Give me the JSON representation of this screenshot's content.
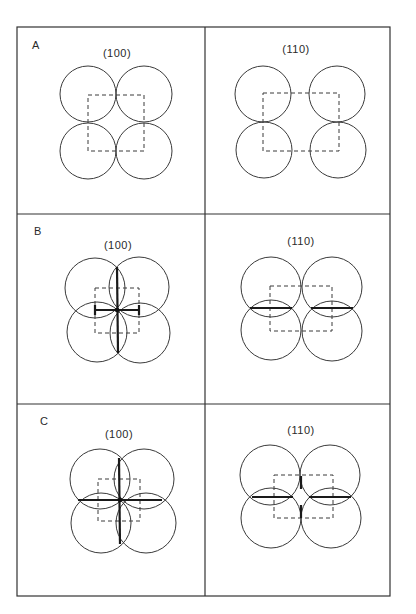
{
  "figure": {
    "frame": {
      "x": 17,
      "y": 27,
      "width": 373,
      "height": 569
    },
    "column_divider_x": 205,
    "row_dividers_y": [
      214,
      404
    ],
    "colors": {
      "line": "#333333",
      "bond": "#1a1a1a",
      "background": "#ffffff"
    },
    "panels": [
      {
        "row": "A",
        "row_label_pos": [
          32,
          49
        ],
        "cells": [
          {
            "plane": "(100)",
            "label_pos": [
              117,
              57
            ],
            "circles": [
              {
                "cx": 88,
                "cy": 94,
                "r": 28
              },
              {
                "cx": 144,
                "cy": 94,
                "r": 28
              },
              {
                "cx": 88,
                "cy": 151,
                "r": 28
              },
              {
                "cx": 144,
                "cy": 151,
                "r": 28
              }
            ],
            "unit_cell": {
              "x": 88,
              "y": 95,
              "w": 56,
              "h": 56
            },
            "bonds": []
          },
          {
            "plane": "(110)",
            "label_pos": [
              296,
              53
            ],
            "circles": [
              {
                "cx": 263,
                "cy": 94,
                "r": 28
              },
              {
                "cx": 337,
                "cy": 94,
                "r": 28
              },
              {
                "cx": 264,
                "cy": 150,
                "r": 28
              },
              {
                "cx": 338,
                "cy": 150,
                "r": 28
              }
            ],
            "unit_cell": {
              "x": 263,
              "y": 93,
              "w": 76,
              "h": 58
            },
            "bonds": []
          }
        ]
      },
      {
        "row": "B",
        "row_label_pos": [
          34,
          235
        ],
        "cells": [
          {
            "plane": "(100)",
            "label_pos": [
              118,
              249
            ],
            "circles": [
              {
                "cx": 95,
                "cy": 288,
                "r": 30
              },
              {
                "cx": 139,
                "cy": 287,
                "r": 30
              },
              {
                "cx": 97,
                "cy": 332,
                "r": 30
              },
              {
                "cx": 140,
                "cy": 333,
                "r": 30
              }
            ],
            "unit_cell": {
              "x": 95,
              "y": 288,
              "w": 44,
              "h": 45
            },
            "bonds": [
              {
                "x1": 117,
                "y1": 267,
                "x2": 118,
                "y2": 353
              },
              {
                "x1": 95,
                "y1": 310,
                "x2": 139,
                "y2": 310
              },
              {
                "x1": 95,
                "y1": 305,
                "x2": 95,
                "y2": 315
              },
              {
                "x1": 139,
                "y1": 305,
                "x2": 139,
                "y2": 315
              }
            ],
            "center_dot": {
              "cx": 117,
              "cy": 310
            }
          },
          {
            "plane": "(110)",
            "label_pos": [
              301,
              245
            ],
            "circles": [
              {
                "cx": 271,
                "cy": 287,
                "r": 30
              },
              {
                "cx": 332,
                "cy": 287,
                "r": 30
              },
              {
                "cx": 271,
                "cy": 330,
                "r": 30
              },
              {
                "cx": 332,
                "cy": 331,
                "r": 30
              }
            ],
            "unit_cell": {
              "x": 270,
              "y": 286,
              "w": 62,
              "h": 45
            },
            "bonds": [
              {
                "x1": 250,
                "y1": 308,
                "x2": 292,
                "y2": 308
              },
              {
                "x1": 311,
                "y1": 308,
                "x2": 353,
                "y2": 308
              }
            ]
          }
        ]
      },
      {
        "row": "C",
        "row_label_pos": [
          40,
          425
        ],
        "cells": [
          {
            "plane": "(100)",
            "label_pos": [
              119,
              438
            ],
            "circles": [
              {
                "cx": 100,
                "cy": 479,
                "r": 30
              },
              {
                "cx": 144,
                "cy": 479,
                "r": 30
              },
              {
                "cx": 101,
                "cy": 523,
                "r": 30
              },
              {
                "cx": 146,
                "cy": 523,
                "r": 30
              }
            ],
            "unit_cell": {
              "x": 98,
              "y": 479,
              "w": 42,
              "h": 42
            },
            "bonds": [
              {
                "x1": 119,
                "y1": 458,
                "x2": 120,
                "y2": 544
              },
              {
                "x1": 78,
                "y1": 500,
                "x2": 162,
                "y2": 500
              }
            ],
            "center_dot": {
              "cx": 120,
              "cy": 500
            }
          },
          {
            "plane": "(110)",
            "label_pos": [
              301,
              434
            ],
            "circles": [
              {
                "cx": 270,
                "cy": 475,
                "r": 30
              },
              {
                "cx": 330,
                "cy": 475,
                "r": 30
              },
              {
                "cx": 271,
                "cy": 518,
                "r": 30
              },
              {
                "cx": 331,
                "cy": 518,
                "r": 30
              }
            ],
            "unit_cell": {
              "x": 274,
              "y": 475,
              "w": 59,
              "h": 43
            },
            "bonds": [
              {
                "x1": 252,
                "y1": 497,
                "x2": 293,
                "y2": 497
              },
              {
                "x1": 309,
                "y1": 497,
                "x2": 351,
                "y2": 497
              },
              {
                "x1": 301,
                "y1": 476,
                "x2": 301,
                "y2": 489
              },
              {
                "x1": 301,
                "y1": 505,
                "x2": 301,
                "y2": 518
              }
            ]
          }
        ]
      }
    ]
  }
}
